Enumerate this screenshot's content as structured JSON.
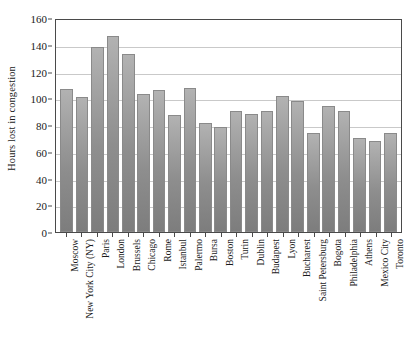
{
  "chart_data": {
    "type": "bar",
    "title": "",
    "xlabel": "",
    "ylabel": "Hours lost in congestion",
    "ylim": [
      0,
      160
    ],
    "yticks": [
      0,
      20,
      40,
      60,
      80,
      100,
      120,
      140,
      160
    ],
    "grid": true,
    "legend": "none",
    "bar_color": "#9a9a9a",
    "categories": [
      "Moscow",
      "New York City (NY)",
      "Paris",
      "London",
      "Brussels",
      "Chicago",
      "Rome",
      "Istanbul",
      "Palermo",
      "Bursa",
      "Boston",
      "Turin",
      "Dublin",
      "Budapest",
      "Lyon",
      "Bucharest",
      "Saint Petersburg",
      "Bogota",
      "Philadelphia",
      "Athens",
      "Mexico City",
      "Toronto"
    ],
    "values": [
      108,
      102,
      140,
      148,
      134,
      104,
      107,
      88,
      109,
      82,
      79,
      91,
      89,
      91,
      103,
      99,
      75,
      95,
      91,
      71,
      69,
      75
    ]
  }
}
